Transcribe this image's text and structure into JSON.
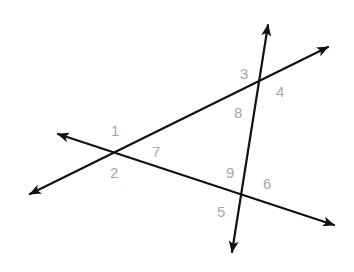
{
  "diagram": {
    "type": "three intersecting lines with numbered angles",
    "line_color": "#111111",
    "label_color": "#a8a8a8",
    "lines": [
      {
        "id": "line-1",
        "from": [
          30,
          194
        ],
        "to": [
          328,
          47
        ],
        "arrows": "both"
      },
      {
        "id": "line-2",
        "from": [
          58,
          134
        ],
        "to": [
          334,
          225
        ],
        "arrows": "both"
      },
      {
        "id": "line-3",
        "from": [
          232,
          252
        ],
        "to": [
          268,
          25
        ],
        "arrows": "both"
      }
    ],
    "intersections": [
      {
        "id": "A",
        "point": [
          114,
          153
        ],
        "lines": [
          "line-1",
          "line-2"
        ]
      },
      {
        "id": "B",
        "point": [
          260,
          82
        ],
        "lines": [
          "line-1",
          "line-3"
        ]
      },
      {
        "id": "C",
        "point": [
          241,
          195
        ],
        "lines": [
          "line-2",
          "line-3"
        ]
      }
    ],
    "labels": [
      {
        "text": "1",
        "x": 111,
        "y": 136
      },
      {
        "text": "2",
        "x": 110,
        "y": 178
      },
      {
        "text": "7",
        "x": 152,
        "y": 157
      },
      {
        "text": "3",
        "x": 240,
        "y": 79
      },
      {
        "text": "4",
        "x": 276,
        "y": 97
      },
      {
        "text": "8",
        "x": 234,
        "y": 118
      },
      {
        "text": "9",
        "x": 226,
        "y": 178
      },
      {
        "text": "6",
        "x": 263,
        "y": 189
      },
      {
        "text": "5",
        "x": 217,
        "y": 217
      }
    ]
  }
}
